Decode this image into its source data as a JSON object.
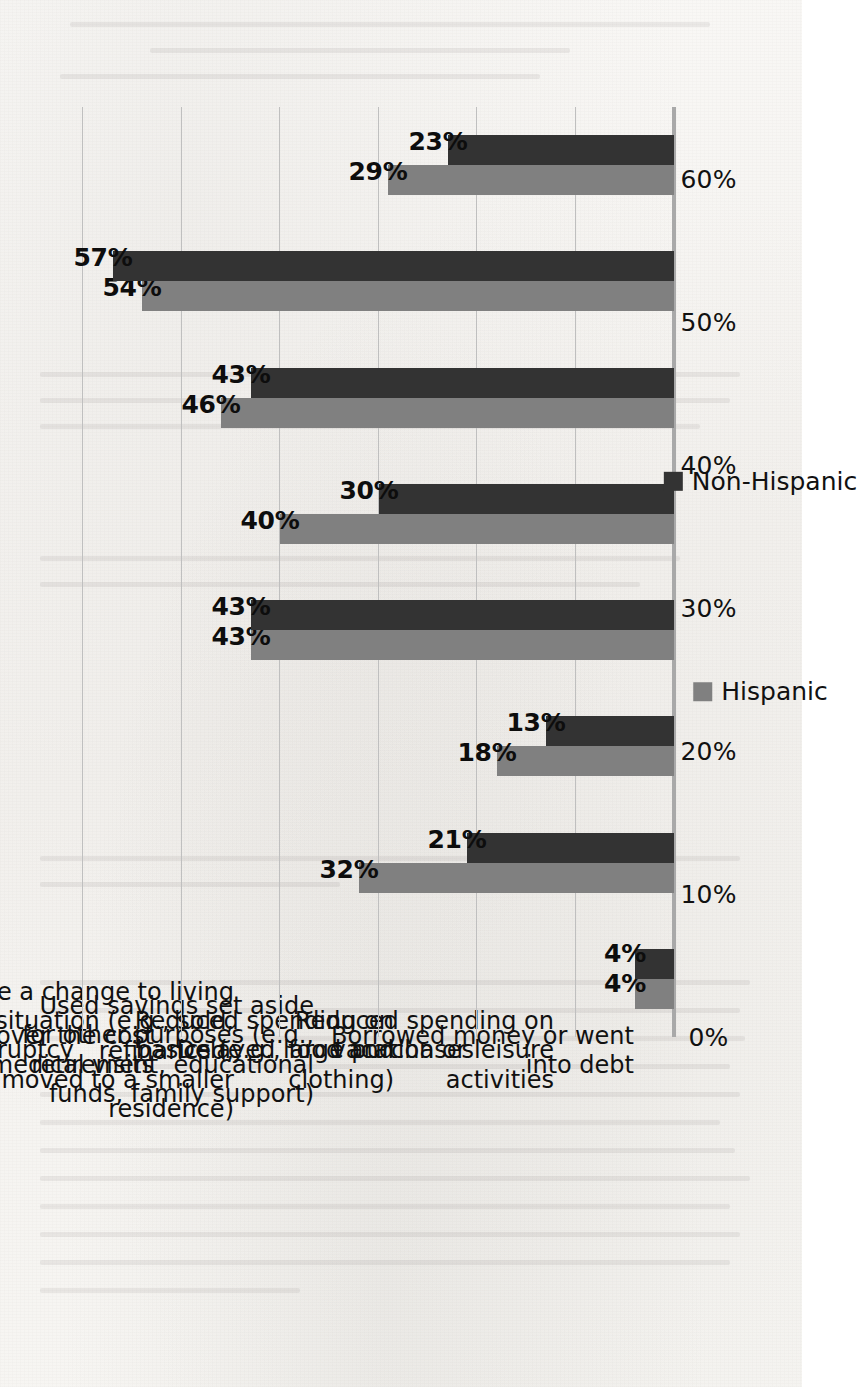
{
  "chart_data": {
    "type": "bar",
    "title": "",
    "xlabel": "",
    "ylabel": "",
    "ylim": [
      0,
      65
    ],
    "grid": true,
    "legend_position": "bottom",
    "orientation": "vertical-bars-rotated-90ccw-on-page",
    "tick_labels": [
      "0%",
      "10%",
      "20%",
      "30%",
      "40%",
      "50%",
      "60%"
    ],
    "tick_values": [
      0,
      10,
      20,
      30,
      40,
      50,
      60
    ],
    "categories": [
      "Filed for bankruptcy",
      "Unable to cover the cost of medical visits",
      "Made a change to living situation (e.g., sold, refinanced,\nor moved to a smaller residence)",
      "Used savings set aside for other purposes (e.g.,\nretirement, educational funds, family support)",
      "Reduced spending on basics (e.g., food and clothing)",
      "Delayed large purchases",
      "Reduced spending on vacation or leisure activities",
      "Borrowed money or went into debt"
    ],
    "series": [
      {
        "name": "Hispanic",
        "color": "#808080",
        "values": [
          4,
          32,
          18,
          43,
          40,
          46,
          54,
          29
        ],
        "labels": [
          "4%",
          "32%",
          "18%",
          "43%",
          "40%",
          "46%",
          "54%",
          "29%"
        ]
      },
      {
        "name": "Non-Hispanic",
        "color": "#333333",
        "values": [
          4,
          21,
          13,
          43,
          30,
          43,
          57,
          23
        ],
        "labels": [
          "4%",
          "21%",
          "13%",
          "43%",
          "30%",
          "43%",
          "57%",
          "23%"
        ]
      }
    ]
  },
  "legend": {
    "items": [
      {
        "label": "Hispanic",
        "color": "#808080"
      },
      {
        "label": "Non-Hispanic",
        "color": "#333333"
      }
    ]
  }
}
